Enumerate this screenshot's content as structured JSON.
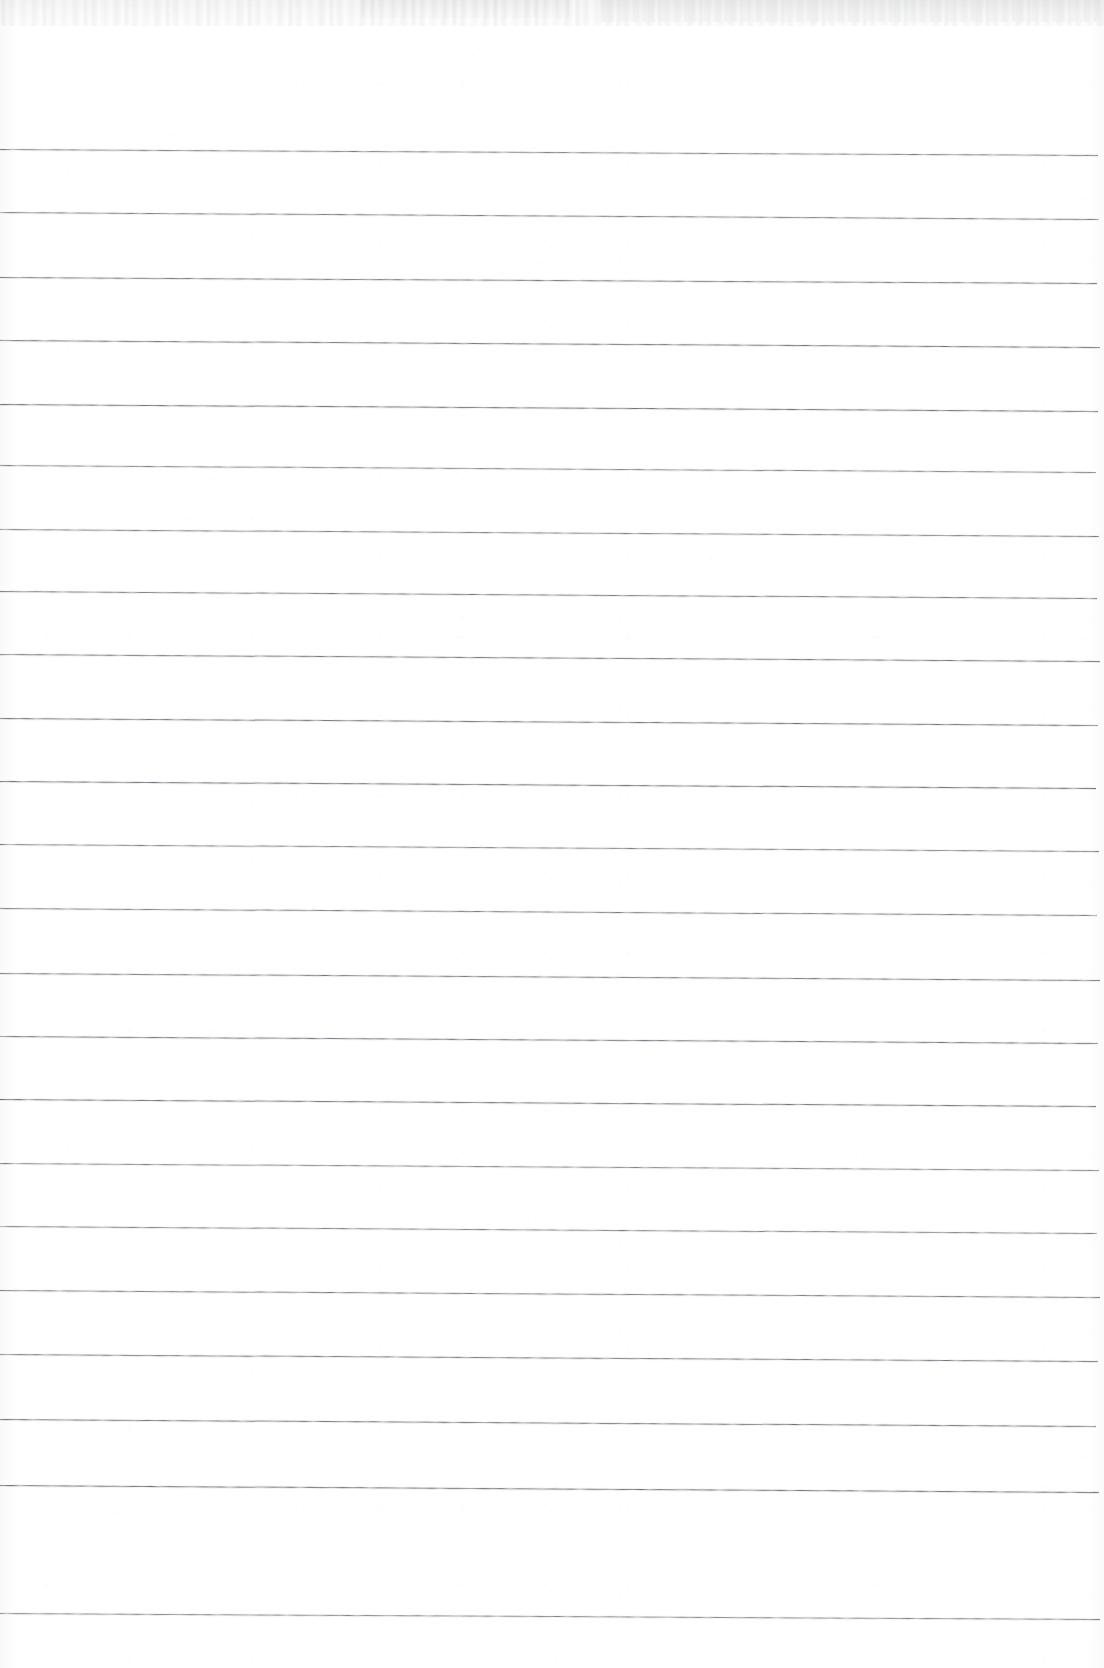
{
  "document": {
    "kind": "scanned-page",
    "title": "Blank ruled notebook page",
    "page_width": 1104,
    "page_height": 1668,
    "background_color": "#ffffff",
    "rule_color": "#606370",
    "has_text": false,
    "has_handwriting": false,
    "has_margin_rule": false,
    "visible_text": ""
  },
  "ruling": {
    "style": "horizontal-ruled",
    "line_count": 23,
    "line_spacing_px": 66.5,
    "first_line_y": 149,
    "last_line_y": 1614,
    "line_thickness_px": 1,
    "line_start_x": 0,
    "line_end_x": 1100,
    "tilt_px_over_width": 6,
    "lines": [
      {
        "index": 1,
        "y_left": 149,
        "y_right": 155,
        "x_start": 0,
        "x_end": 1098
      },
      {
        "index": 2,
        "y_left": 212,
        "y_right": 219,
        "x_start": 0,
        "x_end": 1099
      },
      {
        "index": 3,
        "y_left": 277,
        "y_right": 283,
        "x_start": 0,
        "x_end": 1097
      },
      {
        "index": 4,
        "y_left": 340,
        "y_right": 347,
        "x_start": 0,
        "x_end": 1100
      },
      {
        "index": 5,
        "y_left": 404,
        "y_right": 411,
        "x_start": 0,
        "x_end": 1098
      },
      {
        "index": 6,
        "y_left": 465,
        "y_right": 472,
        "x_start": 0,
        "x_end": 1096
      },
      {
        "index": 7,
        "y_left": 529,
        "y_right": 536,
        "x_start": 0,
        "x_end": 1099
      },
      {
        "index": 8,
        "y_left": 591,
        "y_right": 598,
        "x_start": 0,
        "x_end": 1097
      },
      {
        "index": 9,
        "y_left": 654,
        "y_right": 661,
        "x_start": 0,
        "x_end": 1100
      },
      {
        "index": 10,
        "y_left": 718,
        "y_right": 725,
        "x_start": 0,
        "x_end": 1098
      },
      {
        "index": 11,
        "y_left": 781,
        "y_right": 788,
        "x_start": 0,
        "x_end": 1096
      },
      {
        "index": 12,
        "y_left": 844,
        "y_right": 851,
        "x_start": 0,
        "x_end": 1099
      },
      {
        "index": 13,
        "y_left": 908,
        "y_right": 915,
        "x_start": 0,
        "x_end": 1097
      },
      {
        "index": 14,
        "y_left": 973,
        "y_right": 980,
        "x_start": 0,
        "x_end": 1100
      },
      {
        "index": 15,
        "y_left": 1036,
        "y_right": 1043,
        "x_start": 0,
        "x_end": 1098
      },
      {
        "index": 16,
        "y_left": 1099,
        "y_right": 1106,
        "x_start": 0,
        "x_end": 1096
      },
      {
        "index": 17,
        "y_left": 1163,
        "y_right": 1170,
        "x_start": 0,
        "x_end": 1099
      },
      {
        "index": 18,
        "y_left": 1226,
        "y_right": 1233,
        "x_start": 0,
        "x_end": 1097
      },
      {
        "index": 19,
        "y_left": 1290,
        "y_right": 1297,
        "x_start": 0,
        "x_end": 1100
      },
      {
        "index": 20,
        "y_left": 1354,
        "y_right": 1361,
        "x_start": 0,
        "x_end": 1098
      },
      {
        "index": 21,
        "y_left": 1419,
        "y_right": 1426,
        "x_start": 0,
        "x_end": 1096
      },
      {
        "index": 22,
        "y_left": 1485,
        "y_right": 1492,
        "x_start": 0,
        "x_end": 1099
      },
      {
        "index": 23,
        "y_left": 1613,
        "y_right": 1619,
        "x_start": 0,
        "x_end": 1100
      }
    ]
  },
  "scan_artifacts": {
    "top_edge_noise": true,
    "top_edge_noise_height": 26,
    "edge_shadow_color": "#969aa0",
    "paper_grain": true
  }
}
